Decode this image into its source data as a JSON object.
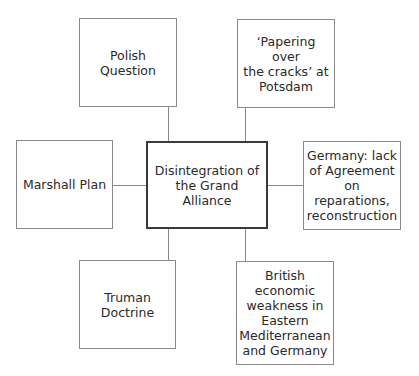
{
  "diagram": {
    "center": {
      "label": "Disintegration of\nthe Grand Alliance"
    },
    "nodes": [
      {
        "id": "polish-question",
        "label": "Polish\nQuestion"
      },
      {
        "id": "potsdam",
        "label": "‘Papering over\nthe cracks’ at\nPotsdam"
      },
      {
        "id": "marshall-plan",
        "label": "Marshall Plan"
      },
      {
        "id": "germany",
        "label": "Germany: lack\nof Agreement\non reparations,\nreconstruction"
      },
      {
        "id": "truman-doctrine",
        "label": "Truman\nDoctrine"
      },
      {
        "id": "british-weakness",
        "label": "British\neconomic\nweakness in\nEastern\nMediterranean\nand Germany"
      }
    ],
    "colors": {
      "border": "#8a8a8a",
      "center_border": "#3a3a3a",
      "text": "#2a2a2a"
    }
  }
}
